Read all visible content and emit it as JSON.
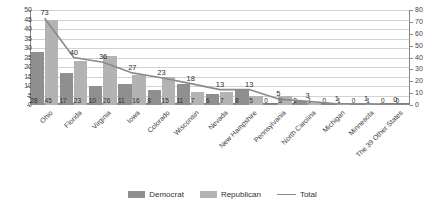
{
  "chart_data": {
    "type": "bar",
    "title": "",
    "xlabel": "",
    "ylabel": "",
    "ylim": [
      0,
      50
    ],
    "y2lim": [
      0,
      80
    ],
    "grid": true,
    "legend_position": "bottom",
    "categories": [
      "Ohio",
      "Florida",
      "Virginia",
      "Iowa",
      "Colorado",
      "Wisconsin",
      "Nevada",
      "New Hampshire",
      "Pennsylvania",
      "North Carolina",
      "Michigan",
      "Minnesota",
      "The 39 Other States"
    ],
    "series": [
      {
        "name": "Democrat",
        "type": "bar",
        "axis": "left",
        "values": [
          28,
          17,
          10,
          11,
          8,
          11,
          6,
          8,
          0,
          2,
          0,
          0,
          0
        ]
      },
      {
        "name": "Republican",
        "type": "bar",
        "axis": "left",
        "values": [
          45,
          23,
          26,
          16,
          15,
          7,
          7,
          5,
          5,
          1,
          1,
          1,
          0
        ]
      },
      {
        "name": "Total",
        "type": "line",
        "axis": "right",
        "values": [
          73,
          40,
          36,
          27,
          23,
          18,
          13,
          13,
          5,
          3,
          1,
          1,
          0
        ]
      }
    ],
    "y_ticks_left": [
      0,
      5,
      10,
      15,
      20,
      25,
      30,
      35,
      40,
      45,
      50
    ],
    "y_ticks_right": [
      0,
      10,
      20,
      30,
      40,
      50,
      60,
      70,
      80
    ],
    "legend": [
      "Democrat",
      "Republican",
      "Total"
    ],
    "colors": {
      "democrat": "#8f8f8f",
      "republican": "#b3b3b3",
      "total": "#8a8a8a",
      "grid": "#d2d2d2",
      "axis": "#888888"
    }
  }
}
